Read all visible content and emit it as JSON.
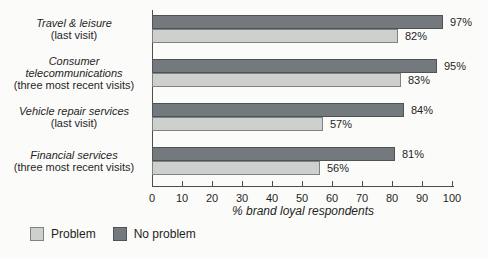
{
  "chart_data": {
    "type": "bar",
    "orientation": "horizontal",
    "xlabel": "% brand loyal respondents",
    "xlim": [
      0,
      100
    ],
    "xticks": [
      0,
      10,
      20,
      30,
      40,
      50,
      60,
      70,
      80,
      90,
      100
    ],
    "value_suffix": "%",
    "grid": false,
    "axis_color": "#4d4d4d",
    "categories": [
      {
        "name": "Travel & leisure",
        "note": "(last visit)"
      },
      {
        "name": "Consumer telecommunications",
        "note": "(three most recent visits)"
      },
      {
        "name": "Vehicle repair services",
        "note": "(last visit)"
      },
      {
        "name": "Financial services",
        "note": "(three most recent visits)"
      }
    ],
    "series": [
      {
        "name": "No problem",
        "color": "#74797d",
        "border": "#4e5356",
        "values": [
          97,
          95,
          84,
          81
        ]
      },
      {
        "name": "Problem",
        "color": "#cdd0cc",
        "border": "#7e8284",
        "values": [
          82,
          83,
          57,
          56
        ]
      }
    ],
    "legend": {
      "position": "bottom-left",
      "items": [
        "Problem",
        "No problem"
      ]
    }
  }
}
